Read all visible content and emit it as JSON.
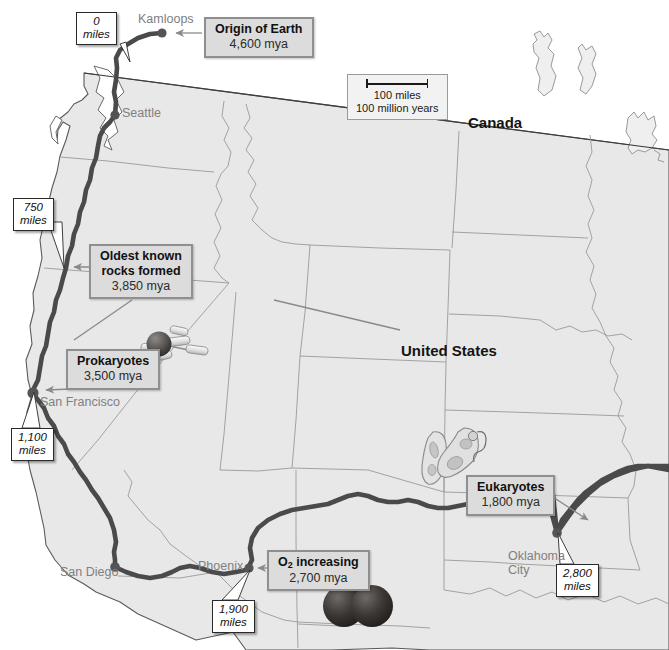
{
  "map": {
    "title_countries": [
      {
        "name": "Canada",
        "label": "Canada",
        "x": 468,
        "y": 114
      },
      {
        "name": "United States",
        "label": "United States",
        "x": 401,
        "y": 342
      }
    ],
    "cities": [
      {
        "name": "Kamloops",
        "label": "Kamloops",
        "x": 138,
        "y": 19,
        "dot_x": 162,
        "dot_y": 33
      },
      {
        "name": "Seattle",
        "label": "Seattle",
        "x": 122,
        "y": 106,
        "dot_x": 115,
        "dot_y": 115
      },
      {
        "name": "San Francisco",
        "label": "San Francisco",
        "x": 38,
        "y": 398,
        "dot_x": 33,
        "dot_y": 393
      },
      {
        "name": "San Diego",
        "label": "San Diego",
        "x": 62,
        "y": 568,
        "dot_x": 115,
        "dot_y": 567
      },
      {
        "name": "Phoenix",
        "label": "Phoenix",
        "x": 199,
        "y": 562,
        "dot_x": 248,
        "dot_y": 568
      },
      {
        "name": "Oklahoma City",
        "label_line1": "Oklahoma",
        "label_line2": "City",
        "x": 508,
        "y": 551,
        "dot_x": 557,
        "dot_y": 533
      }
    ],
    "scale": {
      "distance": "100 miles",
      "time": "100 million years",
      "x": 347,
      "y": 74
    },
    "events": [
      {
        "name": "origin-of-earth",
        "title": "Origin of Earth",
        "age": "4,600 mya",
        "x": 204,
        "y": 17,
        "arrow_to_x": 168,
        "arrow_to_y": 33
      },
      {
        "name": "oldest-known-rocks",
        "title_line1": "Oldest known",
        "title_line2": "rocks formed",
        "age": "3,850 mya",
        "x": 89,
        "y": 244,
        "arrow_to_x": 63,
        "arrow_to_y": 267
      },
      {
        "name": "prokaryotes",
        "title": "Prokaryotes",
        "age": "3,500 mya",
        "x": 66,
        "y": 349,
        "arrow_to_x": 40,
        "arrow_to_y": 390
      },
      {
        "name": "eukaryotes",
        "title": "Eukaryotes",
        "age": "1,800 mya",
        "x": 466,
        "y": 475,
        "arrow_to_x": 554,
        "arrow_to_y": 527
      },
      {
        "name": "oxygen-increasing",
        "title_pre": "O",
        "title_sub": "2",
        "title_post": " increasing",
        "age": "2,700 mya",
        "x": 267,
        "y": 550,
        "arrow_to_x": 252,
        "arrow_to_y": 568
      }
    ],
    "distance_tags": [
      {
        "name": "mile-tag-0",
        "value": "0",
        "unit": "miles",
        "x": 76,
        "y": 12,
        "to_x": 128,
        "to_y": 48
      },
      {
        "name": "mile-tag-750",
        "value": "750",
        "unit": "miles",
        "x": 13,
        "y": 198,
        "to_x": 64,
        "to_y": 268
      },
      {
        "name": "mile-tag-1100",
        "value": "1,100",
        "unit": "miles",
        "x": 11,
        "y": 428,
        "to_x": 36,
        "to_y": 392
      },
      {
        "name": "mile-tag-1900",
        "value": "1,900",
        "unit": "miles",
        "x": 212,
        "y": 600,
        "to_x": 250,
        "to_y": 570
      },
      {
        "name": "mile-tag-2800",
        "value": "2,800",
        "unit": "miles",
        "x": 556,
        "y": 564,
        "to_x": 558,
        "to_y": 533
      }
    ],
    "illustrations": [
      {
        "name": "prokaryote-cells-illustration",
        "x": 143,
        "y": 328
      },
      {
        "name": "eukaryote-cells-illustration",
        "x": 423,
        "y": 427
      },
      {
        "name": "oxygen-molecule-illustration",
        "x": 325,
        "y": 585
      }
    ],
    "colors": {
      "land_fill": "#e8e8e8",
      "land_stroke": "#5a5a5a",
      "state_stroke": "#9a9a9a",
      "route": "#4a4a4a",
      "callout_fill": "#dcdcdc",
      "callout_border": "#8f8f8f",
      "city_text": "#808080",
      "country_text": "#141414",
      "water": "#ffffff"
    }
  }
}
